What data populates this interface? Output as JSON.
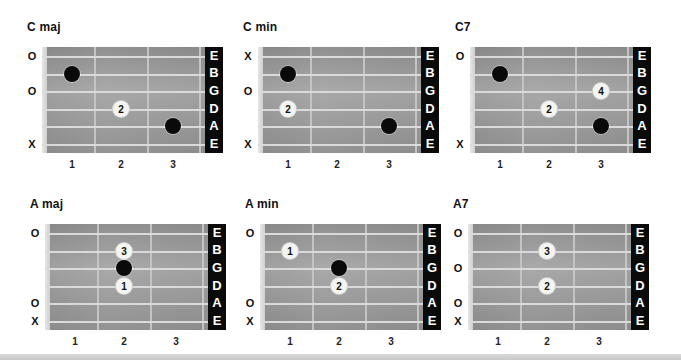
{
  "strings": [
    "E",
    "B",
    "G",
    "D",
    "A",
    "E"
  ],
  "fret_numbers": [
    "1",
    "2",
    "3"
  ],
  "colors": {
    "board": "#9f9f9f",
    "string": "#dadada",
    "label_bg": "#0a0a0a",
    "dot_black": "#0a0a0a",
    "dot_white": "#f4f4f0"
  },
  "chords": [
    {
      "name": "C maj",
      "open": [
        "O",
        "",
        "O",
        "",
        "",
        "X"
      ],
      "dots": [
        {
          "string": 1,
          "fret": 1,
          "type": "black",
          "label": ""
        },
        {
          "string": 3,
          "fret": 2,
          "type": "white",
          "label": "2"
        },
        {
          "string": 4,
          "fret": 3,
          "type": "black",
          "label": ""
        }
      ]
    },
    {
      "name": "C min",
      "open": [
        "X",
        "",
        "O",
        "",
        "",
        "X"
      ],
      "dots": [
        {
          "string": 1,
          "fret": 1,
          "type": "black",
          "label": ""
        },
        {
          "string": 3,
          "fret": 1,
          "type": "white",
          "label": "2"
        },
        {
          "string": 4,
          "fret": 3,
          "type": "black",
          "label": ""
        }
      ]
    },
    {
      "name": "C7",
      "open": [
        "O",
        "",
        "",
        "",
        "",
        "X"
      ],
      "dots": [
        {
          "string": 1,
          "fret": 1,
          "type": "black",
          "label": ""
        },
        {
          "string": 2,
          "fret": 3,
          "type": "white",
          "label": "4"
        },
        {
          "string": 3,
          "fret": 2,
          "type": "white",
          "label": "2"
        },
        {
          "string": 4,
          "fret": 3,
          "type": "black",
          "label": ""
        }
      ]
    },
    {
      "name": "A maj",
      "open": [
        "O",
        "",
        "",
        "",
        "O",
        "X"
      ],
      "dots": [
        {
          "string": 1,
          "fret": 2,
          "type": "white",
          "label": "3"
        },
        {
          "string": 2,
          "fret": 2,
          "type": "black",
          "label": ""
        },
        {
          "string": 3,
          "fret": 2,
          "type": "white",
          "label": "1"
        }
      ]
    },
    {
      "name": "A min",
      "open": [
        "O",
        "",
        "",
        "",
        "O",
        "X"
      ],
      "dots": [
        {
          "string": 1,
          "fret": 1,
          "type": "white",
          "label": "1"
        },
        {
          "string": 2,
          "fret": 2,
          "type": "black",
          "label": ""
        },
        {
          "string": 3,
          "fret": 2,
          "type": "white",
          "label": "2"
        }
      ]
    },
    {
      "name": "A7",
      "open": [
        "O",
        "",
        "O",
        "",
        "O",
        "X"
      ],
      "dots": [
        {
          "string": 1,
          "fret": 2,
          "type": "white",
          "label": "3"
        },
        {
          "string": 3,
          "fret": 2,
          "type": "white",
          "label": "2"
        }
      ]
    }
  ]
}
